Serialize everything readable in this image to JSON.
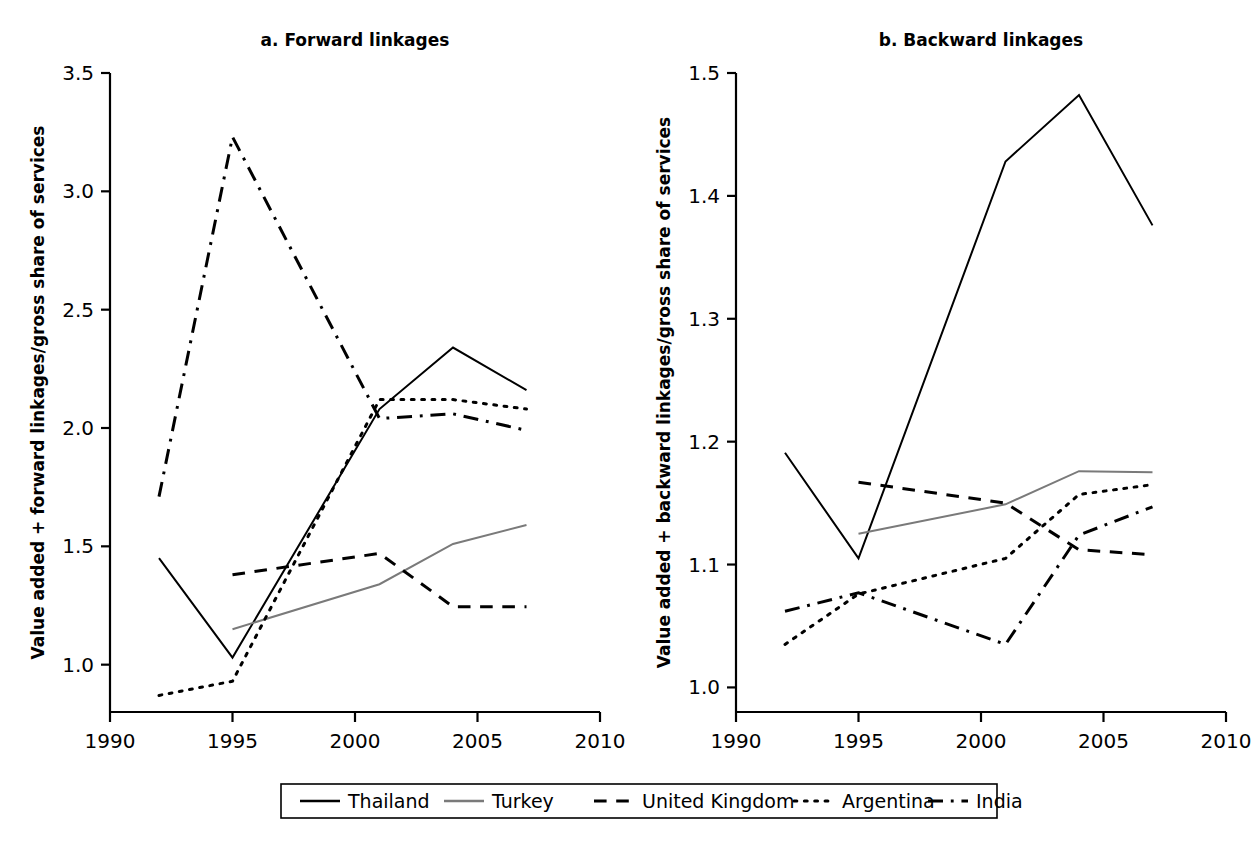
{
  "figure": {
    "width": 1256,
    "height": 851,
    "background": "#ffffff",
    "ink": "#000000",
    "gray": "#7a7a7a"
  },
  "panels": [
    {
      "id": "a",
      "title": "a. Forward linkages",
      "ylabel": "Value added + forward linkages/gross share of services",
      "ylim": [
        0.8,
        3.5
      ],
      "yticks": [
        "1.0",
        "1.5",
        "2.0",
        "2.5",
        "3.0",
        "3.5"
      ],
      "ytick_values": [
        1.0,
        1.5,
        2.0,
        2.5,
        3.0,
        3.5
      ],
      "xlim": [
        1990,
        2010
      ],
      "xticks": [
        "1990",
        "1995",
        "2000",
        "2005",
        "2010"
      ],
      "xtick_values": [
        1990,
        1995,
        2000,
        2005,
        2010
      ]
    },
    {
      "id": "b",
      "title": "b. Backward linkages",
      "ylabel": "Value added + backward linkages/gross share of services",
      "ylim": [
        0.98,
        1.5
      ],
      "yticks": [
        "1.0",
        "1.1",
        "1.2",
        "1.3",
        "1.4",
        "1.5"
      ],
      "ytick_values": [
        1.0,
        1.1,
        1.2,
        1.3,
        1.4,
        1.5
      ],
      "xlim": [
        1990,
        2010
      ],
      "xticks": [
        "1990",
        "1995",
        "2000",
        "2005",
        "2010"
      ],
      "xtick_values": [
        1990,
        1995,
        2000,
        2005,
        2010
      ]
    }
  ],
  "legend": {
    "items": [
      {
        "label": "Thailand",
        "style": "solid",
        "color": "#000000"
      },
      {
        "label": "Turkey",
        "style": "solid",
        "color": "#7a7a7a"
      },
      {
        "label": "United Kingdom",
        "style": "dashed",
        "color": "#000000"
      },
      {
        "label": "Argentina",
        "style": "dotted",
        "color": "#000000"
      },
      {
        "label": "India",
        "style": "dashdot",
        "color": "#000000"
      }
    ]
  },
  "chart_data": [
    {
      "type": "line",
      "panel": "a",
      "title": "a. Forward linkages",
      "xlabel": "",
      "ylabel": "Value added + forward linkages/gross share of services",
      "xlim": [
        1990,
        2010
      ],
      "ylim": [
        0.8,
        3.5
      ],
      "grid": false,
      "legend_position": "bottom-outside",
      "series": [
        {
          "name": "Thailand",
          "style": "solid",
          "color": "#000000",
          "x": [
            1992,
            1995,
            2001,
            2004,
            2007
          ],
          "y": [
            1.45,
            1.03,
            2.08,
            2.34,
            2.16
          ]
        },
        {
          "name": "Turkey",
          "style": "solid",
          "color": "#7a7a7a",
          "x": [
            1995,
            2001,
            2004,
            2007
          ],
          "y": [
            1.15,
            1.34,
            1.51,
            1.59
          ]
        },
        {
          "name": "United Kingdom",
          "style": "dashed",
          "color": "#000000",
          "x": [
            1995,
            2001,
            2004,
            2007
          ],
          "y": [
            1.38,
            1.47,
            1.245,
            1.245
          ]
        },
        {
          "name": "Argentina",
          "style": "dotted",
          "color": "#000000",
          "x": [
            1992,
            1995,
            2001,
            2004,
            2007
          ],
          "y": [
            0.87,
            0.93,
            2.12,
            2.12,
            2.08
          ]
        },
        {
          "name": "India",
          "style": "dashdot",
          "color": "#000000",
          "x": [
            1992,
            1995,
            2001,
            2004,
            2007
          ],
          "y": [
            1.71,
            3.23,
            2.04,
            2.06,
            1.99
          ]
        }
      ]
    },
    {
      "type": "line",
      "panel": "b",
      "title": "b. Backward linkages",
      "xlabel": "",
      "ylabel": "Value added + backward linkages/gross share of services",
      "xlim": [
        1990,
        2010
      ],
      "ylim": [
        0.98,
        1.5
      ],
      "grid": false,
      "legend_position": "bottom-outside",
      "series": [
        {
          "name": "Thailand",
          "style": "solid",
          "color": "#000000",
          "x": [
            1992,
            1995,
            2001,
            2004,
            2007
          ],
          "y": [
            1.191,
            1.105,
            1.428,
            1.482,
            1.376
          ]
        },
        {
          "name": "Turkey",
          "style": "solid",
          "color": "#7a7a7a",
          "x": [
            1995,
            2001,
            2004,
            2007
          ],
          "y": [
            1.125,
            1.149,
            1.176,
            1.175
          ]
        },
        {
          "name": "United Kingdom",
          "style": "dashed",
          "color": "#000000",
          "x": [
            1995,
            2001,
            2004,
            2007
          ],
          "y": [
            1.167,
            1.15,
            1.112,
            1.108
          ]
        },
        {
          "name": "Argentina",
          "style": "dotted",
          "color": "#000000",
          "x": [
            1992,
            1995,
            2001,
            2004,
            2007
          ],
          "y": [
            1.035,
            1.076,
            1.105,
            1.157,
            1.165
          ]
        },
        {
          "name": "India",
          "style": "dashdot",
          "color": "#000000",
          "x": [
            1992,
            1995,
            2001,
            2004,
            2007
          ],
          "y": [
            1.062,
            1.077,
            1.035,
            1.124,
            1.147
          ]
        }
      ]
    }
  ]
}
